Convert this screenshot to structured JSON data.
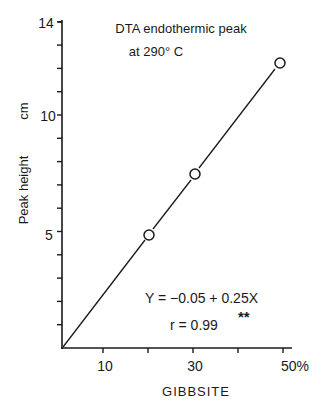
{
  "chart_data": {
    "type": "scatter",
    "title": "DTA endothermic peak",
    "subtitle": "at 290° C",
    "xlabel": "GIBBSITE",
    "ylabel": "Peak height",
    "ylabel_unit": "cm",
    "xlim": [
      0,
      52
    ],
    "ylim": [
      0,
      14
    ],
    "x_ticks": [
      10,
      20,
      30,
      40,
      50
    ],
    "x_tick_labels": [
      "10",
      "",
      "30",
      "",
      "50%"
    ],
    "y_ticks": [
      1,
      2,
      3,
      4,
      5,
      6,
      7,
      8,
      9,
      10,
      11,
      12,
      13,
      14
    ],
    "y_tick_labels": {
      "5": "5",
      "10": "10",
      "14": "14"
    },
    "grid": false,
    "series": [
      {
        "name": "Observed",
        "marker": "open-circle",
        "x": [
          20,
          30,
          50
        ],
        "y": [
          4.9,
          7.5,
          12.3
        ]
      },
      {
        "name": "Regression line",
        "type": "line",
        "x": [
          0,
          50
        ],
        "y": [
          -0.05,
          12.45
        ]
      }
    ],
    "annotations": {
      "equation": "Y = −0.05 + 0.25X",
      "r_label": "r = 0.99",
      "significance": "**"
    }
  }
}
